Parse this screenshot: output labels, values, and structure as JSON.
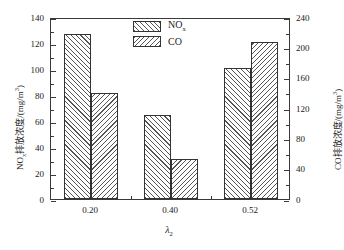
{
  "chart_data": {
    "type": "bar",
    "title": "",
    "categories": [
      "0.20",
      "0.40",
      "0.52"
    ],
    "series": [
      {
        "name": "NOx",
        "name_html": "NO<sub>x</sub>",
        "axis": "left",
        "values": [
          126.73,
          64.35,
          101.09
        ],
        "labels": [
          "126.73",
          "64.35",
          "101.09"
        ],
        "hatch": "forward-diagonal"
      },
      {
        "name": "CO",
        "name_html": "CO",
        "axis": "right",
        "values": [
          139.36,
          52.15,
          207.28
        ],
        "labels": [
          "139.36",
          "52.15",
          "207.28"
        ],
        "hatch": "backward-diagonal"
      }
    ],
    "xlabel": "λ₂",
    "xlabel_symbol": "λ",
    "xlabel_subscript": "2",
    "ylabel_left": "NOₓ排放浓度/(mg/m³)",
    "ylabel_left_parts": {
      "prefix": "NO",
      "sub": "x",
      "middle": "排放浓度/(mg/m",
      "sup": "3",
      "suffix": ")"
    },
    "ylabel_right": "CO排放浓度/(mg/m³)",
    "ylabel_right_parts": {
      "prefix": "CO排放浓度/(mg/m",
      "sup": "3",
      "suffix": ")"
    },
    "ylim_left": [
      0,
      140
    ],
    "ylim_right": [
      0,
      240
    ],
    "yticks_left": [
      "0",
      "20",
      "40",
      "60",
      "80",
      "100",
      "120",
      "140"
    ],
    "yticks_right": [
      "0",
      "40",
      "80",
      "120",
      "160",
      "200",
      "240"
    ],
    "yticks_left_values": [
      0,
      20,
      40,
      60,
      80,
      100,
      120,
      140
    ],
    "yticks_right_values": [
      0,
      40,
      80,
      120,
      160,
      200,
      240
    ],
    "grid": false,
    "legend_position": "top-center",
    "legend_entries": [
      "NOx",
      "CO"
    ],
    "frame": true,
    "minor_ticks": true
  },
  "colors": {
    "axis": "#3a3a3a",
    "hatch": "#555555",
    "background": "#ffffff",
    "text": "#1a1a1a"
  }
}
